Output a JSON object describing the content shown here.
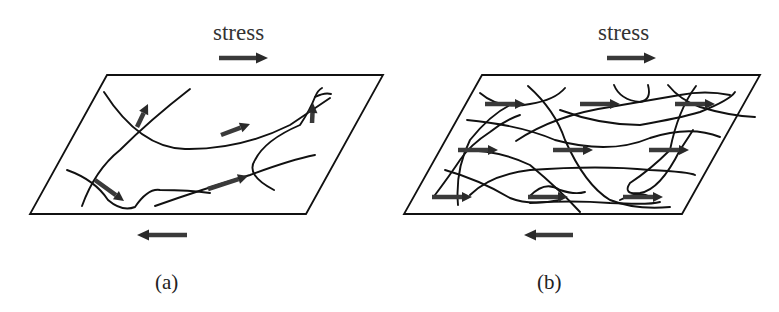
{
  "figure": {
    "panels": [
      {
        "id": "a",
        "label": "(a)",
        "stress_label": "stress",
        "description": "sparse fiber network with few, randomly oriented load arrows",
        "plate": [
          [
            107,
            75
          ],
          [
            383,
            75
          ],
          [
            306,
            214
          ],
          [
            30,
            214
          ]
        ],
        "stress_top_arrow": {
          "x1": 219,
          "x2": 268,
          "y": 58,
          "direction": "right"
        },
        "stress_bottom_arrow": {
          "x1": 187,
          "x2": 137,
          "y": 235,
          "direction": "left"
        },
        "fibers": [
          "M 104 92 Q 140 148 185 149 Q 240 150 290 125 L 330 98",
          "M 190 89 Q 150 120 120 150 Q 95 170 82 206",
          "M 67 170 Q 95 180 108 200 Q 122 212 135 207 Q 148 188 160 190 Q 190 190 210 193",
          "M 155 206 Q 200 190 250 175 Q 290 160 315 155",
          "M 274 190 Q 245 175 255 160 Q 265 140 300 125 Q 310 110 315 97 Q 318 90 322 88",
          "M 315 97 Q 325 92 331 94"
        ],
        "force_arrows": [
          {
            "x1": 137,
            "y1": 127,
            "x2": 148,
            "y2": 104
          },
          {
            "x1": 221,
            "y1": 135,
            "x2": 250,
            "y2": 124
          },
          {
            "x1": 312,
            "y1": 123,
            "x2": 313,
            "y2": 103
          },
          {
            "x1": 95,
            "y1": 180,
            "x2": 124,
            "y2": 201
          },
          {
            "x1": 208,
            "y1": 189,
            "x2": 248,
            "y2": 176
          }
        ]
      },
      {
        "id": "b",
        "label": "(b)",
        "stress_label": "stress",
        "description": "dense entangled fiber network with many load arrows aligned with stress",
        "plate": [
          [
            482,
            75
          ],
          [
            760,
            75
          ],
          [
            682,
            214
          ],
          [
            404,
            214
          ]
        ],
        "stress_top_arrow": {
          "x1": 607,
          "x2": 656,
          "y": 58,
          "direction": "right"
        },
        "stress_bottom_arrow": {
          "x1": 573,
          "x2": 524,
          "y": 235,
          "direction": "left"
        },
        "fibers": [
          "M 480 93 Q 500 110 530 104 Q 555 100 565 88",
          "M 528 86 Q 555 110 565 140 Q 585 185 610 200 Q 635 210 670 207",
          "M 614 85 Q 620 100 640 102 Q 652 100 648 85",
          "M 668 85 Q 680 100 700 107 Q 730 116 755 117",
          "M 696 86 Q 678 110 670 150 Q 650 170 630 183 Q 622 195 640 193 Q 660 190 680 150 Q 690 135 693 130",
          "M 467 120 Q 520 125 555 140 Q 610 155 650 138 Q 690 125 720 137",
          "M 516 141 Q 555 115 610 107 Q 650 100 680 95 Q 705 90 730 95",
          "M 560 110 Q 600 125 640 125 Q 680 118 700 112 Q 730 100 735 92",
          "M 460 150 Q 500 150 530 165 Q 560 190 580 212",
          "M 445 170 Q 480 180 510 198 Q 530 206 560 200",
          "M 470 195 Q 490 175 530 170 Q 600 165 650 170 Q 690 172 695 175",
          "M 435 195 Q 450 175 460 160 Q 470 145 490 132 Q 505 120 520 115",
          "M 458 205 Q 455 170 470 140 Q 490 115 510 105",
          "M 530 196 Q 545 180 560 190 Q 575 195 585 192",
          "M 530 203 Q 570 200 610 203 Q 650 205 660 202",
          "M 620 200 Q 640 190 650 197"
        ],
        "force_arrows": [
          {
            "x1": 485,
            "y1": 104,
            "x2": 525,
            "y2": 104
          },
          {
            "x1": 580,
            "y1": 104,
            "x2": 620,
            "y2": 104
          },
          {
            "x1": 675,
            "y1": 104,
            "x2": 715,
            "y2": 104
          },
          {
            "x1": 458,
            "y1": 150,
            "x2": 498,
            "y2": 150
          },
          {
            "x1": 553,
            "y1": 150,
            "x2": 593,
            "y2": 150
          },
          {
            "x1": 649,
            "y1": 150,
            "x2": 689,
            "y2": 150
          },
          {
            "x1": 432,
            "y1": 197,
            "x2": 472,
            "y2": 197
          },
          {
            "x1": 528,
            "y1": 197,
            "x2": 568,
            "y2": 197
          },
          {
            "x1": 623,
            "y1": 197,
            "x2": 663,
            "y2": 197
          }
        ]
      }
    ]
  }
}
